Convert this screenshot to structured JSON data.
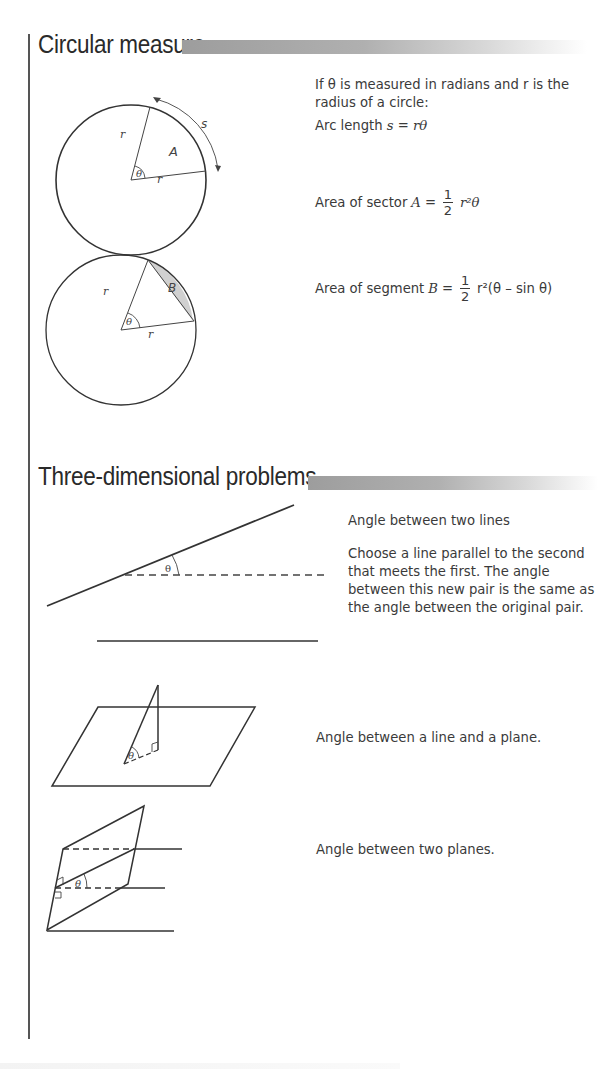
{
  "sections": [
    {
      "title": "Circular measure",
      "intro": "If θ is measured in radians and r is the radius of a circle:",
      "formulas": {
        "arc_length": {
          "label": "Arc length",
          "lhs": "s",
          "rhs": "rθ"
        },
        "sector_area": {
          "label": "Area of sector",
          "lhs": "A",
          "frac_num": "1",
          "frac_den": "2",
          "rhs": "r²θ"
        },
        "segment_area": {
          "label": "Area of segment",
          "lhs": "B",
          "frac_num": "1",
          "frac_den": "2",
          "rhs": "r²(θ – sin θ)"
        }
      },
      "diagrams": {
        "sector": {
          "labels": {
            "radius1": "r",
            "radius2": "r",
            "angle": "θ",
            "area": "A",
            "arc": "s"
          }
        },
        "segment": {
          "labels": {
            "radius1": "r",
            "radius2": "r",
            "angle": "θ",
            "area": "B"
          },
          "fill": "#d0d0d0"
        }
      }
    },
    {
      "title": "Three-dimensional problems",
      "items": [
        {
          "heading": "Angle between two lines",
          "body": "Choose a line parallel to the second that meets the first. The angle between this new pair is the same as the angle between the original pair.",
          "angle_label": "θ"
        },
        {
          "heading": "Angle between a line and a plane.",
          "angle_label": "θ"
        },
        {
          "heading": "Angle between two planes.",
          "angle_label": "θ"
        }
      ]
    }
  ],
  "colors": {
    "header_bar_start": "#9d9d9d",
    "text": "#3a3a3a",
    "line": "#333333"
  }
}
